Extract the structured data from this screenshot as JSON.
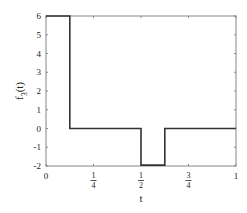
{
  "chart_data": {
    "type": "line",
    "style": "step",
    "title": "",
    "xlabel": "t",
    "ylabel": "f_3(t)",
    "ylabel_main": "f",
    "ylabel_sub": "3",
    "ylabel_arg": "(t)",
    "xlim": [
      0,
      1
    ],
    "ylim": [
      -2,
      6
    ],
    "grid": false,
    "legend": null,
    "x_ticks": [
      {
        "value": 0,
        "label": "0"
      },
      {
        "value": 0.25,
        "num": "1",
        "den": "4"
      },
      {
        "value": 0.5,
        "num": "1",
        "den": "2"
      },
      {
        "value": 0.75,
        "num": "3",
        "den": "4"
      },
      {
        "value": 1,
        "label": "1"
      }
    ],
    "y_ticks": [
      {
        "value": 6,
        "label": "6"
      },
      {
        "value": 5,
        "label": "5"
      },
      {
        "value": 4,
        "label": "4"
      },
      {
        "value": 3,
        "label": "3"
      },
      {
        "value": 2,
        "label": "2"
      },
      {
        "value": 1,
        "label": "1"
      },
      {
        "value": 0,
        "label": "0"
      },
      {
        "value": -1,
        "label": "-1"
      },
      {
        "value": -2,
        "label": "-2"
      }
    ],
    "series": [
      {
        "name": "f_3(t)",
        "color": "#333333",
        "points": [
          [
            0,
            6
          ],
          [
            0.125,
            6
          ],
          [
            0.125,
            0
          ],
          [
            0.5,
            0
          ],
          [
            0.5,
            -1.95
          ],
          [
            0.625,
            -1.95
          ],
          [
            0.625,
            0
          ],
          [
            1,
            0
          ]
        ]
      }
    ]
  }
}
